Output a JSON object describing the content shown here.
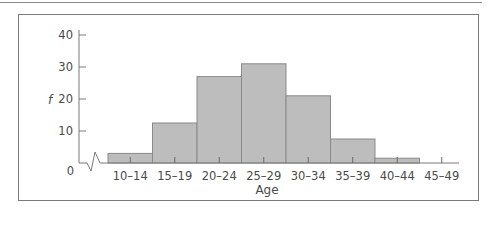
{
  "chart_data": {
    "type": "bar",
    "subtype": "histogram",
    "title": "",
    "xlabel": "Age",
    "ylabel": "f",
    "categories": [
      "10–14",
      "15–19",
      "20–24",
      "25–29",
      "30–34",
      "35–39",
      "40–44",
      "45–49"
    ],
    "values": [
      3,
      12.5,
      27,
      31,
      21,
      7.5,
      1.5,
      0
    ],
    "ylim": [
      0,
      40
    ],
    "yticks": [
      0,
      10,
      20,
      30,
      40
    ],
    "grid": false,
    "legend": null,
    "axis_break": "x-axis zigzag break near origin",
    "colors": {
      "bar_fill": "#bdbdbd",
      "bar_stroke": "#8a8a8a",
      "axis": "#7a7a7a"
    }
  },
  "labels": {
    "ylabel": "f",
    "xlabel": "Age",
    "yticks": [
      "0",
      "10",
      "20",
      "30",
      "40"
    ],
    "xticks": [
      "10–14",
      "15–19",
      "20–24",
      "25–29",
      "30–34",
      "35–39",
      "40–44",
      "45–49"
    ]
  }
}
